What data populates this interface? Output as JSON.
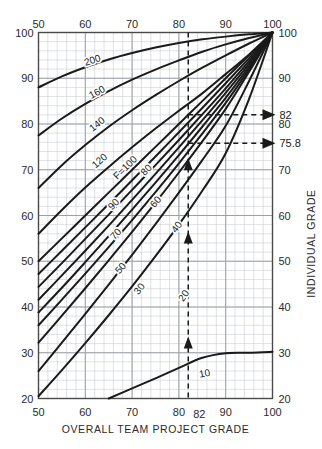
{
  "chart_data": {
    "type": "line",
    "title": "",
    "xlabel": "OVERALL TEAM PROJECT GRADE",
    "ylabel_left": "",
    "ylabel_right": "INDIVIDUAL GRADE",
    "xlim": [
      50,
      100
    ],
    "ylim": [
      20,
      100
    ],
    "xticks": [
      50,
      60,
      70,
      80,
      90,
      100
    ],
    "xticklabels": [
      "50",
      "60",
      "70",
      "80",
      "90",
      "100"
    ],
    "xticks_top": [
      50,
      60,
      70,
      80,
      90,
      100
    ],
    "xticklabels_top": [
      "50",
      "60",
      "70",
      "80",
      "90",
      "100"
    ],
    "yticks_left": [
      20,
      30,
      40,
      50,
      60,
      70,
      80,
      90,
      100
    ],
    "yticklabels_left": [
      "20",
      "30",
      "40",
      "50",
      "60",
      "70",
      "80",
      "90",
      "100"
    ],
    "yticks_right": [
      20,
      30,
      40,
      50,
      60,
      70,
      80,
      90,
      100
    ],
    "yticklabels_right": [
      "20",
      "30",
      "40",
      "50",
      "60",
      "70",
      "80",
      "90",
      "100"
    ],
    "grid": true,
    "grid_major_step": 10,
    "grid_minor_step": 2,
    "legend": "none",
    "series": [
      {
        "name": "200",
        "label": "200",
        "label_x": 61.5,
        "label_y": 94.0,
        "points": [
          [
            50,
            88.0
          ],
          [
            55,
            90.4
          ],
          [
            60,
            92.4
          ],
          [
            65,
            94.1
          ],
          [
            70,
            95.5
          ],
          [
            75,
            96.7
          ],
          [
            80,
            97.7
          ],
          [
            85,
            98.5
          ],
          [
            90,
            99.1
          ],
          [
            95,
            99.6
          ],
          [
            100,
            100
          ]
        ]
      },
      {
        "name": "160",
        "label": "160",
        "label_x": 62.5,
        "label_y": 87.0,
        "points": [
          [
            50,
            77.5
          ],
          [
            55,
            81.2
          ],
          [
            60,
            84.4
          ],
          [
            65,
            87.2
          ],
          [
            70,
            89.7
          ],
          [
            75,
            91.9
          ],
          [
            80,
            93.9
          ],
          [
            85,
            95.8
          ],
          [
            90,
            97.4
          ],
          [
            95,
            98.8
          ],
          [
            100,
            100
          ]
        ]
      },
      {
        "name": "140",
        "label": "140",
        "label_x": 62.5,
        "label_y": 80.0,
        "points": [
          [
            50,
            66.0
          ],
          [
            55,
            71.0
          ],
          [
            60,
            75.4
          ],
          [
            65,
            79.4
          ],
          [
            70,
            83.0
          ],
          [
            75,
            86.3
          ],
          [
            80,
            89.4
          ],
          [
            85,
            92.3
          ],
          [
            90,
            95.0
          ],
          [
            95,
            97.6
          ],
          [
            100,
            100
          ]
        ]
      },
      {
        "name": "120",
        "label": "120",
        "label_x": 63.0,
        "label_y": 72.0,
        "points": [
          [
            50,
            56.0
          ],
          [
            55,
            61.2
          ],
          [
            60,
            66.1
          ],
          [
            65,
            70.6
          ],
          [
            70,
            74.9
          ],
          [
            75,
            79.0
          ],
          [
            80,
            82.9
          ],
          [
            85,
            86.7
          ],
          [
            90,
            90.9
          ],
          [
            95,
            95.2
          ],
          [
            100,
            100
          ]
        ]
      },
      {
        "name": "F100",
        "label": "F=100",
        "label_x": 68.5,
        "label_y": 70.5,
        "points": [
          [
            50,
            50.0
          ],
          [
            55,
            55.0
          ],
          [
            60,
            60.0
          ],
          [
            65,
            65.0
          ],
          [
            70,
            70.0
          ],
          [
            75,
            75.0
          ],
          [
            80,
            80.0
          ],
          [
            85,
            85.0
          ],
          [
            90,
            90.0
          ],
          [
            95,
            95.0
          ],
          [
            100,
            100
          ]
        ]
      },
      {
        "name": "90",
        "label": "90",
        "label_x": 66.0,
        "label_y": 62.5,
        "points": [
          [
            50,
            47.2
          ],
          [
            55,
            52.3
          ],
          [
            60,
            57.4
          ],
          [
            65,
            62.5
          ],
          [
            70,
            67.7
          ],
          [
            75,
            72.9
          ],
          [
            80,
            78.2
          ],
          [
            85,
            83.5
          ],
          [
            90,
            88.9
          ],
          [
            95,
            94.4
          ],
          [
            100,
            100
          ]
        ]
      },
      {
        "name": "80",
        "label": "80",
        "label_x": 73.0,
        "label_y": 70.0,
        "points": [
          [
            50,
            44.4
          ],
          [
            55,
            49.6
          ],
          [
            60,
            54.9
          ],
          [
            65,
            60.2
          ],
          [
            70,
            65.6
          ],
          [
            75,
            71.0
          ],
          [
            80,
            76.5
          ],
          [
            85,
            82.1
          ],
          [
            90,
            87.8
          ],
          [
            95,
            93.8
          ],
          [
            100,
            100
          ]
        ]
      },
      {
        "name": "70",
        "label": "70",
        "label_x": 66.5,
        "label_y": 56.0,
        "points": [
          [
            50,
            41.6
          ],
          [
            55,
            46.9
          ],
          [
            60,
            52.3
          ],
          [
            65,
            57.8
          ],
          [
            70,
            63.4
          ],
          [
            75,
            69.1
          ],
          [
            80,
            74.9
          ],
          [
            85,
            80.8
          ],
          [
            90,
            86.8
          ],
          [
            95,
            93.2
          ],
          [
            100,
            100
          ]
        ]
      },
      {
        "name": "60",
        "label": "60",
        "label_x": 75.0,
        "label_y": 63.0,
        "points": [
          [
            50,
            38.8
          ],
          [
            55,
            44.2
          ],
          [
            60,
            49.8
          ],
          [
            65,
            55.5
          ],
          [
            70,
            61.3
          ],
          [
            75,
            67.2
          ],
          [
            80,
            73.2
          ],
          [
            85,
            79.4
          ],
          [
            90,
            85.7
          ],
          [
            95,
            92.6
          ],
          [
            100,
            100
          ]
        ]
      },
      {
        "name": "50",
        "label": "50",
        "label_x": 67.5,
        "label_y": 48.5,
        "points": [
          [
            50,
            36.0
          ],
          [
            55,
            41.6
          ],
          [
            60,
            47.3
          ],
          [
            65,
            53.1
          ],
          [
            70,
            59.0
          ],
          [
            75,
            65.1
          ],
          [
            80,
            71.4
          ],
          [
            85,
            77.9
          ],
          [
            90,
            84.6
          ],
          [
            95,
            92.0
          ],
          [
            100,
            100
          ]
        ]
      },
      {
        "name": "40",
        "label": "40",
        "label_x": 79.5,
        "label_y": 57.5,
        "points": [
          [
            50,
            32.2
          ],
          [
            55,
            38.1
          ],
          [
            60,
            44.1
          ],
          [
            65,
            50.2
          ],
          [
            70,
            56.4
          ],
          [
            75,
            62.8
          ],
          [
            80,
            69.4
          ],
          [
            85,
            76.2
          ],
          [
            90,
            83.3
          ],
          [
            95,
            91.4
          ],
          [
            100,
            100
          ]
        ]
      },
      {
        "name": "30",
        "label": "30",
        "label_x": 71.5,
        "label_y": 44.0,
        "points": [
          [
            50,
            26.0
          ],
          [
            55,
            32.2
          ],
          [
            60,
            38.5
          ],
          [
            65,
            44.9
          ],
          [
            70,
            51.4
          ],
          [
            75,
            58.1
          ],
          [
            80,
            65.0
          ],
          [
            85,
            72.1
          ],
          [
            90,
            79.6
          ],
          [
            95,
            89.4
          ],
          [
            100,
            100
          ]
        ]
      },
      {
        "name": "20",
        "label": "20",
        "label_x": 81.0,
        "label_y": 42.5,
        "points": [
          [
            50,
            20.5
          ],
          [
            55,
            26.2
          ],
          [
            60,
            32.1
          ],
          [
            65,
            38.2
          ],
          [
            70,
            44.5
          ],
          [
            75,
            51.1
          ],
          [
            80,
            58.0
          ],
          [
            85,
            65.4
          ],
          [
            90,
            73.6
          ],
          [
            95,
            85.5
          ],
          [
            100,
            100
          ]
        ]
      },
      {
        "name": "10",
        "label": "10",
        "label_x": 85.5,
        "label_y": 25.5,
        "points": [
          [
            65,
            20.0
          ],
          [
            70,
            22.2
          ],
          [
            75,
            24.4
          ],
          [
            80,
            26.7
          ],
          [
            85,
            28.9
          ],
          [
            90,
            29.9
          ],
          [
            95,
            30.0
          ],
          [
            100,
            30.2
          ]
        ]
      }
    ],
    "annotations": {
      "vline_x": 82,
      "vline_label": "82",
      "hlines": [
        {
          "y": 82.0,
          "from_x": 82,
          "to_x": 100,
          "label": "82"
        },
        {
          "y": 75.8,
          "from_x": 82,
          "to_x": 100,
          "label": "75.8"
        }
      ],
      "up_arrows_y": [
        32,
        55,
        71
      ]
    }
  },
  "axes": {
    "x_title": "OVERALL TEAM PROJECT GRADE",
    "y_right_title": "INDIVIDUAL GRADE"
  },
  "colors": {
    "curve": "#1a1a1a",
    "grid_major": "#9aa0a6",
    "grid_minor": "#c9ccd1",
    "frame": "#4a4a4a",
    "dashed": "#1a1a1a",
    "text": "#2b2b2b",
    "background": "#ffffff"
  }
}
